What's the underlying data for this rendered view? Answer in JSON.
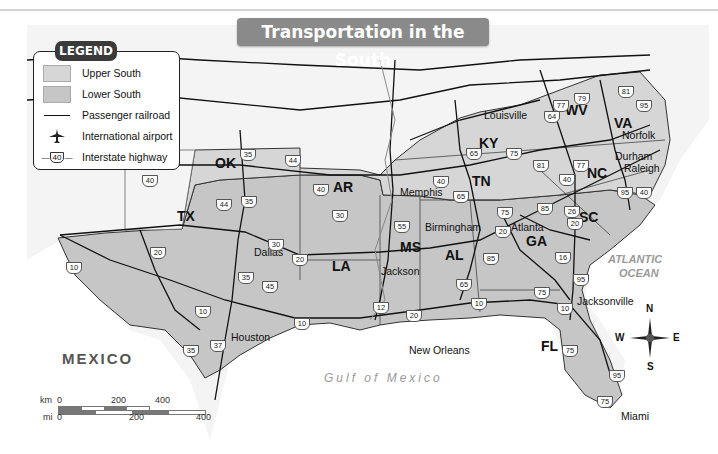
{
  "title": "Transportation in the South",
  "legend": {
    "title": "LEGEND",
    "items": [
      {
        "symbol": "swatch",
        "color": "#d6d6d6",
        "label": "Upper South"
      },
      {
        "symbol": "swatch",
        "color": "#c6c6c6",
        "label": "Lower South"
      },
      {
        "symbol": "line",
        "label": "Passenger railroad"
      },
      {
        "symbol": "airplane-icon",
        "label": "International airport"
      },
      {
        "symbol": "interstate-shield",
        "shield": "40",
        "label": "Interstate highway"
      }
    ]
  },
  "states": {
    "ok": "OK",
    "ar": "AR",
    "tx": "TX",
    "la": "LA",
    "ms": "MS",
    "al": "AL",
    "tn": "TN",
    "ky": "KY",
    "ga": "GA",
    "fl": "FL",
    "sc": "SC",
    "nc": "NC",
    "va": "VA",
    "wv": "WV"
  },
  "cities": {
    "louisville": "Louisville",
    "norfolk": "Norfolk",
    "durham": "Durham",
    "raleigh": "Raleigh",
    "memphis": "Memphis",
    "birmingham": "Birmingham",
    "atlanta": "Atlanta",
    "dallas": "Dallas",
    "jackson": "Jackson",
    "houston": "Houston",
    "new_orleans": "New Orleans",
    "jacksonville": "Jacksonville",
    "miami": "Miami"
  },
  "water": {
    "atlantic1": "ATLANTIC",
    "atlantic2": "OCEAN",
    "gulf": "Gulf of Mexico"
  },
  "country": {
    "mexico": "MEXICO"
  },
  "highways": [
    {
      "n": "35",
      "x": 240,
      "y": 149
    },
    {
      "n": "44",
      "x": 285,
      "y": 155
    },
    {
      "n": "40",
      "x": 142,
      "y": 175
    },
    {
      "n": "40",
      "x": 313,
      "y": 184
    },
    {
      "n": "44",
      "x": 216,
      "y": 199
    },
    {
      "n": "35",
      "x": 241,
      "y": 196
    },
    {
      "n": "30",
      "x": 332,
      "y": 210
    },
    {
      "n": "30",
      "x": 268,
      "y": 239
    },
    {
      "n": "20",
      "x": 292,
      "y": 254
    },
    {
      "n": "20",
      "x": 150,
      "y": 247
    },
    {
      "n": "10",
      "x": 66,
      "y": 262
    },
    {
      "n": "35",
      "x": 238,
      "y": 272
    },
    {
      "n": "45",
      "x": 262,
      "y": 281
    },
    {
      "n": "10",
      "x": 195,
      "y": 306
    },
    {
      "n": "37",
      "x": 210,
      "y": 340
    },
    {
      "n": "35",
      "x": 183,
      "y": 345
    },
    {
      "n": "10",
      "x": 294,
      "y": 318
    },
    {
      "n": "55",
      "x": 394,
      "y": 221
    },
    {
      "n": "20",
      "x": 406,
      "y": 310
    },
    {
      "n": "12",
      "x": 373,
      "y": 302
    },
    {
      "n": "65",
      "x": 453,
      "y": 191
    },
    {
      "n": "40",
      "x": 433,
      "y": 176
    },
    {
      "n": "65",
      "x": 466,
      "y": 148
    },
    {
      "n": "75",
      "x": 506,
      "y": 148
    },
    {
      "n": "77",
      "x": 553,
      "y": 100
    },
    {
      "n": "64",
      "x": 544,
      "y": 111
    },
    {
      "n": "79",
      "x": 574,
      "y": 93
    },
    {
      "n": "81",
      "x": 618,
      "y": 86
    },
    {
      "n": "95",
      "x": 636,
      "y": 100
    },
    {
      "n": "81",
      "x": 533,
      "y": 160
    },
    {
      "n": "77",
      "x": 573,
      "y": 160
    },
    {
      "n": "40",
      "x": 559,
      "y": 174
    },
    {
      "n": "95",
      "x": 617,
      "y": 187
    },
    {
      "n": "40",
      "x": 636,
      "y": 187
    },
    {
      "n": "75",
      "x": 497,
      "y": 207
    },
    {
      "n": "85",
      "x": 537,
      "y": 203
    },
    {
      "n": "26",
      "x": 564,
      "y": 206
    },
    {
      "n": "20",
      "x": 567,
      "y": 218
    },
    {
      "n": "20",
      "x": 495,
      "y": 226
    },
    {
      "n": "85",
      "x": 483,
      "y": 253
    },
    {
      "n": "16",
      "x": 555,
      "y": 252
    },
    {
      "n": "65",
      "x": 456,
      "y": 279
    },
    {
      "n": "95",
      "x": 573,
      "y": 274
    },
    {
      "n": "75",
      "x": 534,
      "y": 287
    },
    {
      "n": "10",
      "x": 471,
      "y": 298
    },
    {
      "n": "10",
      "x": 557,
      "y": 303
    },
    {
      "n": "75",
      "x": 562,
      "y": 345
    },
    {
      "n": "95",
      "x": 609,
      "y": 370
    },
    {
      "n": "75",
      "x": 597,
      "y": 396
    }
  ],
  "compass": {
    "n": "N",
    "s": "S",
    "e": "E",
    "w": "W"
  },
  "scale_bar": {
    "km_label": "km",
    "km_ticks": [
      "0",
      "200",
      "400"
    ],
    "mi_label": "mi",
    "mi_ticks": [
      "0",
      "200",
      "400"
    ]
  },
  "colors": {
    "upper_south": "#d6d6d6",
    "lower_south": "#c6c6c6",
    "land_other": "#f4f4f4",
    "water": "#ffffff",
    "title_bg": "#8a8a8a"
  }
}
